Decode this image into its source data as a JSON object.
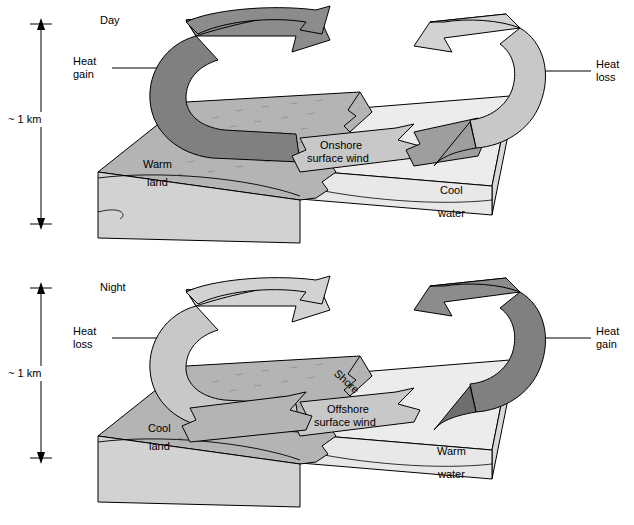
{
  "figure": {
    "type": "diagram",
    "panels": [
      {
        "id": "day",
        "title": "Day",
        "scale_label": "~ 1 km",
        "left_annotation": "Heat\ngain",
        "left_annotation_line1": "Heat",
        "left_annotation_line2": "gain",
        "right_annotation_line1": "Heat",
        "right_annotation_line2": "loss",
        "land_label_line1": "Warm",
        "land_label_line2": "land",
        "water_label_line1": "Cool",
        "water_label_line2": "water",
        "wind_label_line1": "Onshore",
        "wind_label_line2": "surface wind",
        "shore_label": "",
        "land_arrow_tone": "dark",
        "water_arrow_tone": "light",
        "surface_wind_direction": "onshore (water to land, leftward)"
      },
      {
        "id": "night",
        "title": "Night",
        "scale_label": "~ 1 km",
        "left_annotation_line1": "Heat",
        "left_annotation_line2": "loss",
        "right_annotation_line1": "Heat",
        "right_annotation_line2": "gain",
        "land_label_line1": "Cool",
        "land_label_line2": "land",
        "water_label_line1": "Warm",
        "water_label_line2": "water",
        "wind_label_line1": "Offshore",
        "wind_label_line2": "surface wind",
        "shore_label": "Shore",
        "land_arrow_tone": "light",
        "water_arrow_tone": "dark",
        "surface_wind_direction": "offshore (land to water, leftward)"
      }
    ],
    "colors": {
      "arrow_dark": "#808080",
      "arrow_light": "#c8c8c8",
      "land_top": "#b4b4b4",
      "land_side": "#c6c6c6",
      "land_front": "#d2d2d2",
      "water_top": "#ececec",
      "water_side": "#d8d8d8",
      "water_front": "#e4e4e4",
      "outline": "#000000",
      "background": "#ffffff"
    }
  }
}
